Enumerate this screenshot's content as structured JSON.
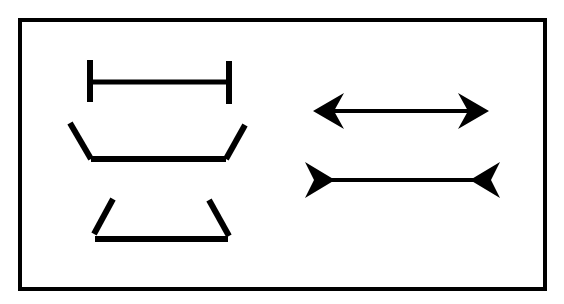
{
  "diagram": {
    "colors": {
      "background": "#ffffff",
      "stroke": "#000000"
    },
    "frame": {
      "x": 18,
      "y": 18,
      "width": 529,
      "height": 273,
      "stroke_width": 4
    },
    "figures": [
      {
        "id": "i-beam",
        "type": "segment-with-end-bars",
        "y": 82,
        "x1": 90,
        "x2": 229
      },
      {
        "id": "bowl",
        "type": "segment-with-outward-wings",
        "y": 159,
        "x1": 91,
        "x2": 226
      },
      {
        "id": "trapezoid",
        "type": "segment-with-inward-wings",
        "y": 239,
        "x1": 95,
        "x2": 228
      },
      {
        "id": "arrow-outward",
        "type": "segment-with-outward-arrowheads",
        "y": 111,
        "x1": 313,
        "x2": 489
      },
      {
        "id": "arrow-inward",
        "type": "segment-with-inward-fins",
        "y": 180,
        "x1": 334,
        "x2": 470
      }
    ]
  }
}
